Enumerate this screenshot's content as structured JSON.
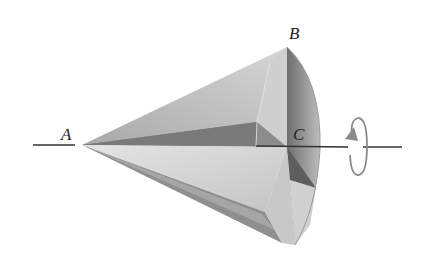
{
  "diagram": {
    "type": "cone-rotation",
    "labels": {
      "apex": "A",
      "rim_point": "B",
      "base_center": "C"
    },
    "annotations": {
      "rotation_arrow": "rotation about axis AC"
    },
    "colors": {
      "axis": "#333333",
      "rotation_arrow": "#8a8a8a",
      "surface_light": "#d9d9d9",
      "surface_mid": "#b5b5b5",
      "surface_dark": "#7a7a7a"
    }
  }
}
